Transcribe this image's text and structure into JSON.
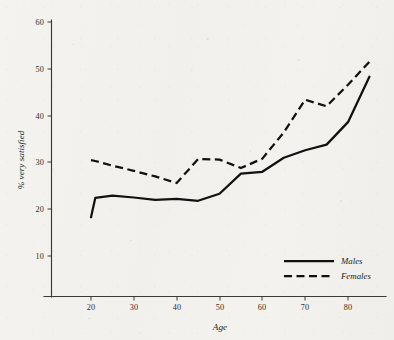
{
  "chart_data": {
    "type": "line",
    "title": "",
    "subtitle": "",
    "xlabel": "Age",
    "ylabel": "% very satisfied",
    "xlim": [
      14,
      88
    ],
    "ylim": [
      0,
      60
    ],
    "xticks": [
      20,
      30,
      40,
      50,
      60,
      70,
      80
    ],
    "yticks": [
      10,
      20,
      30,
      40,
      50,
      60
    ],
    "grid": false,
    "legend_position": "bottom-right",
    "x": [
      20,
      21,
      25,
      30,
      35,
      40,
      45,
      50,
      55,
      60,
      65,
      70,
      75,
      80,
      85
    ],
    "series": [
      {
        "name": "Males",
        "style": "solid",
        "color": "#121110",
        "values": [
          18.3,
          22.4,
          22.9,
          22.5,
          22.0,
          22.2,
          21.8,
          23.3,
          27.6,
          28.0,
          31.0,
          32.6,
          33.8,
          38.6,
          48.3
        ]
      },
      {
        "name": "Females",
        "style": "dashed",
        "color": "#121110",
        "values": [
          30.5,
          30.3,
          29.3,
          28.2,
          27.0,
          25.6,
          30.7,
          30.6,
          28.8,
          30.8,
          36.4,
          43.4,
          42.0,
          46.6,
          51.5
        ]
      }
    ]
  },
  "axes": {
    "x_tick_labels": [
      "20",
      "30",
      "40",
      "50",
      "60",
      "70",
      "80"
    ],
    "y_tick_labels": [
      "10",
      "20",
      "30",
      "40",
      "50",
      "60"
    ],
    "x_axis_title": "Age",
    "y_axis_title": "% very satisfied"
  },
  "legend": {
    "entries": [
      {
        "label": "Males",
        "style": "solid"
      },
      {
        "label": "Females",
        "style": "dashed"
      }
    ]
  },
  "colors": {
    "background": "#f3f2ef",
    "ink": "#121110",
    "axis": "#3b3a38"
  }
}
